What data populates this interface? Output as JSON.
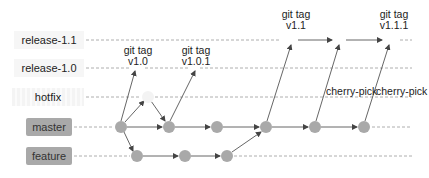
{
  "branches": [
    {
      "name": "release-1.1",
      "style": "plain"
    },
    {
      "name": "release-1.0",
      "style": "plain"
    },
    {
      "name": "hotfix",
      "style": "hotfix"
    },
    {
      "name": "master",
      "style": "boxed"
    },
    {
      "name": "feature",
      "style": "boxed"
    }
  ],
  "tags": [
    {
      "line1": "git tag",
      "line2": "v1.0"
    },
    {
      "line1": "git tag",
      "line2": "v1.0.1"
    },
    {
      "line1": "git tag",
      "line2": "v1.1"
    },
    {
      "line1": "git tag",
      "line2": "v1.1.1"
    }
  ],
  "annotations": [
    {
      "text": "cherry-pick"
    },
    {
      "text": "cherry-pick"
    }
  ],
  "colors": {
    "node": "#a9a9a9",
    "line": "#555555",
    "dash": "#9a9a9a",
    "label_box": "#a9a9a9"
  }
}
